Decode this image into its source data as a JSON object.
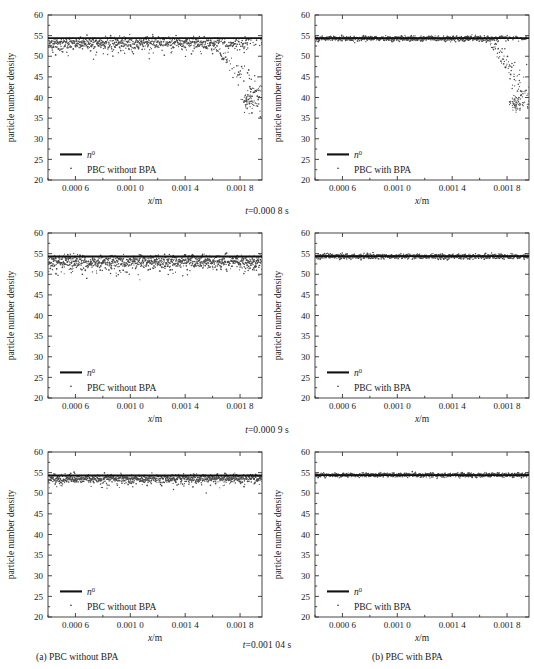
{
  "figure": {
    "rows": [
      {
        "caption_prefix": "t=",
        "caption_value": "0.000 8 s"
      },
      {
        "caption_prefix": "t=",
        "caption_value": "0.000 9 s"
      },
      {
        "caption_prefix": "t=",
        "caption_value": "0.001 04 s"
      }
    ],
    "subcaptions": {
      "left": "(a) PBC without BPA",
      "right": "(b) PBC with BPA"
    }
  },
  "chart_data": [
    {
      "id": "panel-r0c0",
      "type": "scatter",
      "title": "",
      "xlabel": "x/m",
      "ylabel": "particle number density",
      "xlim": [
        0.0004,
        0.00196
      ],
      "ylim": [
        20,
        60
      ],
      "xticks": [
        0.0006,
        0.001,
        0.0014,
        0.0018
      ],
      "xticklabels": [
        "0.000 6",
        "0.001 0",
        "0.001 4",
        "0.001 8"
      ],
      "yticks": [
        20,
        25,
        30,
        35,
        40,
        45,
        50,
        55,
        60
      ],
      "yticklabels": [
        "20",
        "25",
        "30",
        "35",
        "40",
        "45",
        "50",
        "55",
        "60"
      ],
      "grid": false,
      "legend_position": "lower-left",
      "series": [
        {
          "name": "n0",
          "kind": "line",
          "label": "n⁰",
          "value": 54.4
        },
        {
          "name": "pbc",
          "kind": "scatter",
          "label": "PBC without BPA",
          "baseline": 53.3,
          "spread": 1.6,
          "tail_start": 0.0015,
          "tail_drop_to": 39.0,
          "tail_scatter": 5.0,
          "n_points": 900
        }
      ]
    },
    {
      "id": "panel-r0c1",
      "type": "scatter",
      "title": "",
      "xlabel": "x/m",
      "ylabel": "particle number density",
      "xlim": [
        0.0004,
        0.00196
      ],
      "ylim": [
        20,
        60
      ],
      "xticks": [
        0.0006,
        0.001,
        0.0014,
        0.0018
      ],
      "xticklabels": [
        "0.000 6",
        "0.001 0",
        "0.001 4",
        "0.001 8"
      ],
      "yticks": [
        20,
        25,
        30,
        35,
        40,
        45,
        50,
        55,
        60
      ],
      "yticklabels": [
        "20",
        "25",
        "30",
        "35",
        "40",
        "45",
        "50",
        "55",
        "60"
      ],
      "grid": false,
      "legend_position": "lower-left",
      "series": [
        {
          "name": "n0",
          "kind": "line",
          "label": "n⁰",
          "value": 54.4
        },
        {
          "name": "pbc",
          "kind": "scatter",
          "label": "PBC with BPA",
          "baseline": 54.3,
          "spread": 0.75,
          "tail_start": 0.00162,
          "tail_drop_to": 38.5,
          "tail_scatter": 5.5,
          "n_points": 900
        }
      ]
    },
    {
      "id": "panel-r1c0",
      "type": "scatter",
      "title": "",
      "xlabel": "x/m",
      "ylabel": "particle number density",
      "xlim": [
        0.0004,
        0.00196
      ],
      "ylim": [
        20,
        60
      ],
      "xticks": [
        0.0006,
        0.001,
        0.0014,
        0.0018
      ],
      "xticklabels": [
        "0.000 6",
        "0.001 0",
        "0.001 4",
        "0.001 8"
      ],
      "yticks": [
        20,
        25,
        30,
        35,
        40,
        45,
        50,
        55,
        60
      ],
      "yticklabels": [
        "20",
        "25",
        "30",
        "35",
        "40",
        "45",
        "50",
        "55",
        "60"
      ],
      "grid": false,
      "legend_position": "lower-left",
      "series": [
        {
          "name": "n0",
          "kind": "line",
          "label": "n⁰",
          "value": 54.3
        },
        {
          "name": "pbc",
          "kind": "scatter",
          "label": "PBC without BPA",
          "baseline": 53.1,
          "spread": 1.9,
          "tail_start": null,
          "tail_drop_to": null,
          "tail_scatter": 0,
          "n_points": 1000
        }
      ]
    },
    {
      "id": "panel-r1c1",
      "type": "scatter",
      "title": "",
      "xlabel": "x/m",
      "ylabel": "particle number density",
      "xlim": [
        0.0004,
        0.00196
      ],
      "ylim": [
        20,
        60
      ],
      "xticks": [
        0.0006,
        0.001,
        0.0014,
        0.0018
      ],
      "xticklabels": [
        "0.000 6",
        "0.001 0",
        "0.001 4",
        "0.001 8"
      ],
      "yticks": [
        20,
        25,
        30,
        35,
        40,
        45,
        50,
        55,
        60
      ],
      "yticklabels": [
        "20",
        "25",
        "30",
        "35",
        "40",
        "45",
        "50",
        "55",
        "60"
      ],
      "grid": false,
      "legend_position": "lower-left",
      "series": [
        {
          "name": "n0",
          "kind": "line",
          "label": "n⁰",
          "value": 54.4
        },
        {
          "name": "pbc",
          "kind": "scatter",
          "label": "PBC with BPA",
          "baseline": 54.3,
          "spread": 0.7,
          "tail_start": null,
          "tail_drop_to": null,
          "tail_scatter": 0,
          "n_points": 950
        }
      ]
    },
    {
      "id": "panel-r2c0",
      "type": "scatter",
      "title": "",
      "xlabel": "x/m",
      "ylabel": "particle number density",
      "xlim": [
        0.0004,
        0.00196
      ],
      "ylim": [
        20,
        60
      ],
      "xticks": [
        0.0006,
        0.001,
        0.0014,
        0.0018
      ],
      "xticklabels": [
        "0.000 6",
        "0.001 0",
        "0.001 4",
        "0.001 8"
      ],
      "yticks": [
        20,
        25,
        30,
        35,
        40,
        45,
        50,
        55,
        60
      ],
      "yticklabels": [
        "20",
        "25",
        "30",
        "35",
        "40",
        "45",
        "50",
        "55",
        "60"
      ],
      "grid": false,
      "legend_position": "lower-left",
      "series": [
        {
          "name": "n0",
          "kind": "line",
          "label": "n⁰",
          "value": 54.3
        },
        {
          "name": "pbc",
          "kind": "scatter",
          "label": "PBC without BPA",
          "baseline": 53.6,
          "spread": 1.2,
          "tail_start": null,
          "tail_drop_to": null,
          "tail_scatter": 0,
          "n_points": 1000
        }
      ]
    },
    {
      "id": "panel-r2c1",
      "type": "scatter",
      "title": "",
      "xlabel": "x/m",
      "ylabel": "particle number density",
      "xlim": [
        0.0004,
        0.00196
      ],
      "ylim": [
        20,
        60
      ],
      "xticks": [
        0.0006,
        0.001,
        0.0014,
        0.0018
      ],
      "xticklabels": [
        "0.000 6",
        "0.001 0",
        "0.001 4",
        "0.001 8"
      ],
      "yticks": [
        20,
        25,
        30,
        35,
        40,
        45,
        50,
        55,
        60
      ],
      "yticklabels": [
        "20",
        "25",
        "30",
        "35",
        "40",
        "45",
        "50",
        "55",
        "60"
      ],
      "grid": false,
      "legend_position": "lower-left",
      "series": [
        {
          "name": "n0",
          "kind": "line",
          "label": "n⁰",
          "value": 54.4
        },
        {
          "name": "pbc",
          "kind": "scatter",
          "label": "PBC with BPA",
          "baseline": 54.4,
          "spread": 0.6,
          "tail_start": null,
          "tail_drop_to": null,
          "tail_scatter": 0,
          "n_points": 950
        }
      ]
    }
  ]
}
